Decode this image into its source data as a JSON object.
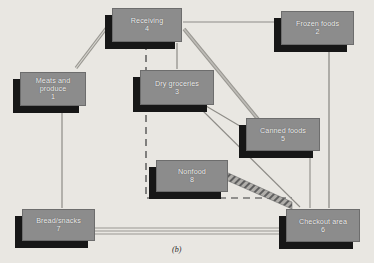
{
  "figure": {
    "caption": "(b)",
    "background_color": "#e9e7e2",
    "node_face_color": "#8c8c8c",
    "node_shadow_color": "#171717",
    "line_color": "#8e8e8e"
  },
  "nodes": [
    {
      "id": "meats",
      "number": "1",
      "lines": [
        "Meats and",
        "produce"
      ],
      "label": "Meats and produce",
      "x": 20,
      "y": 72,
      "w": 66,
      "h": 34
    },
    {
      "id": "frozen",
      "number": "2",
      "lines": [
        "Frozen foods"
      ],
      "label": "Frozen foods",
      "x": 281,
      "y": 11,
      "w": 73,
      "h": 34
    },
    {
      "id": "dry",
      "number": "3",
      "lines": [
        "Dry groceries"
      ],
      "label": "Dry groceries",
      "x": 140,
      "y": 70,
      "w": 74,
      "h": 35
    },
    {
      "id": "receiving",
      "number": "4",
      "lines": [
        "Receiving"
      ],
      "label": "Receiving",
      "x": 112,
      "y": 8,
      "w": 70,
      "h": 34
    },
    {
      "id": "canned",
      "number": "5",
      "lines": [
        "Canned foods"
      ],
      "label": "Canned foods",
      "x": 246,
      "y": 118,
      "w": 74,
      "h": 33
    },
    {
      "id": "checkout",
      "number": "6",
      "lines": [
        "Checkout area"
      ],
      "label": "Checkout area",
      "x": 286,
      "y": 209,
      "w": 74,
      "h": 33
    },
    {
      "id": "bread",
      "number": "7",
      "lines": [
        "Bread/snacks"
      ],
      "label": "Bread/snacks",
      "x": 22,
      "y": 209,
      "w": 73,
      "h": 32
    },
    {
      "id": "nonfood",
      "number": "8",
      "lines": [
        "Nonfood"
      ],
      "label": "Nonfood",
      "x": 156,
      "y": 160,
      "w": 72,
      "h": 32
    }
  ],
  "edges": [
    {
      "from": "receiving",
      "to": "meats",
      "style": "double-thin"
    },
    {
      "from": "receiving",
      "to": "frozen",
      "style": "thin"
    },
    {
      "from": "receiving",
      "to": "dry",
      "style": "thin"
    },
    {
      "from": "receiving",
      "to": "canned",
      "style": "thick"
    },
    {
      "from": "receiving",
      "to": "checkout",
      "style": "dashed"
    },
    {
      "from": "meats",
      "to": "bread",
      "style": "thin"
    },
    {
      "from": "dry",
      "to": "canned",
      "style": "thin"
    },
    {
      "from": "dry",
      "to": "checkout",
      "style": "thin"
    },
    {
      "from": "frozen",
      "to": "checkout",
      "style": "thin"
    },
    {
      "from": "canned",
      "to": "checkout",
      "style": "thin"
    },
    {
      "from": "nonfood",
      "to": "checkout",
      "style": "hatched"
    },
    {
      "from": "bread",
      "to": "checkout",
      "style": "double-thin"
    }
  ]
}
